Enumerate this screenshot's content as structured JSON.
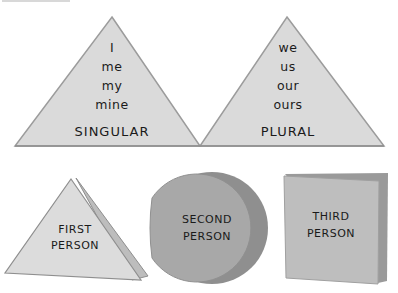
{
  "colors": {
    "light_fill": "#d9d9d9",
    "light_edge": "#9a9a9a",
    "circle_fill": "#a6a6a6",
    "circle_shadow": "#8a8a8a",
    "square_fill": "#bdbdbd",
    "square_shadow": "#999999",
    "text": "#1a1a1a"
  },
  "top_triangles": [
    {
      "name": "singular",
      "words": [
        "I",
        "me",
        "my",
        "mine"
      ],
      "caption": "SINGULAR"
    },
    {
      "name": "plural",
      "words": [
        "we",
        "us",
        "our",
        "ours"
      ],
      "caption": "PLURAL"
    }
  ],
  "bottom_shapes": [
    {
      "shape": "triangle",
      "line1": "FIRST",
      "line2": "PERSON"
    },
    {
      "shape": "circle",
      "line1": "SECOND",
      "line2": "PERSON"
    },
    {
      "shape": "square",
      "line1": "THIRD",
      "line2": "PERSON"
    }
  ]
}
